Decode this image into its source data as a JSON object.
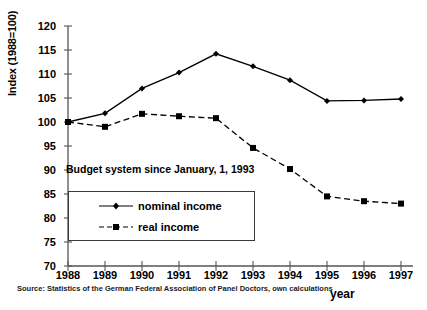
{
  "chart_data": {
    "type": "line",
    "title": "",
    "xlabel": "year",
    "ylabel": "Index (1988=100)",
    "categories": [
      "1988",
      "1989",
      "1990",
      "1991",
      "1992",
      "1993",
      "1994",
      "1995",
      "1996",
      "1997"
    ],
    "x": [
      1988,
      1989,
      1990,
      1991,
      1992,
      1993,
      1994,
      1995,
      1996,
      1997
    ],
    "xlim": [
      1988,
      1997
    ],
    "ylim": [
      70,
      120
    ],
    "ytick_labels": [
      "120",
      "115",
      "110",
      "105",
      "100",
      "95",
      "90",
      "85",
      "80",
      "75",
      "70"
    ],
    "yticks": [
      120,
      115,
      110,
      105,
      100,
      95,
      90,
      85,
      80,
      75,
      70
    ],
    "grid": false,
    "legend_position": "inside-lower-left",
    "series": [
      {
        "name": "nominal income",
        "marker": "diamond",
        "linestyle": "solid",
        "color": "#000000",
        "values": [
          100.0,
          101.8,
          107.0,
          110.3,
          114.2,
          111.6,
          108.7,
          104.4,
          104.5,
          104.8
        ]
      },
      {
        "name": "real income",
        "marker": "square",
        "linestyle": "dashed",
        "color": "#000000",
        "values": [
          100.0,
          99.0,
          101.7,
          101.2,
          100.8,
          94.6,
          90.2,
          84.5,
          83.5,
          83.0
        ]
      }
    ],
    "annotations": [
      {
        "text": "Budget system since January, 1, 1993"
      }
    ],
    "source": "Source: Statistics of the German Federal Association of Panel Doctors, own calculations",
    "axis_color": "#555555"
  }
}
